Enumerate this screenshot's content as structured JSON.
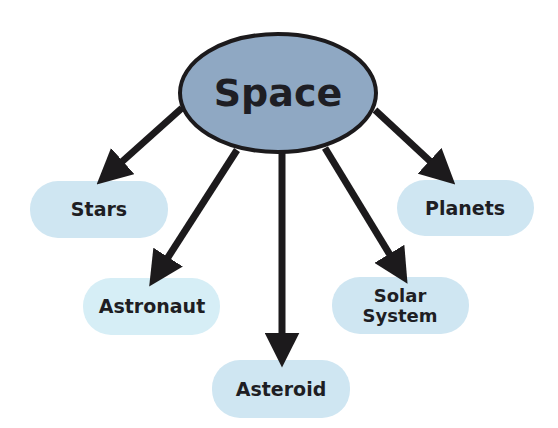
{
  "diagram": {
    "type": "mind-map",
    "colors": {
      "center_fill": "#8fa8c3",
      "center_stroke": "#1c1a1c",
      "leaf_fill": "#cfe6f2",
      "arrow": "#1c1a1c",
      "text": "#1e1e24"
    },
    "center": {
      "label": "Space"
    },
    "nodes": [
      {
        "id": "stars",
        "label": "Stars"
      },
      {
        "id": "astronaut",
        "label": "Astronaut"
      },
      {
        "id": "asteroid",
        "label": "Asteroid"
      },
      {
        "id": "solar-system",
        "label_line1": "Solar",
        "label_line2": "System"
      },
      {
        "id": "planets",
        "label": "Planets"
      }
    ],
    "edges": [
      {
        "from": "Space",
        "to": "Stars"
      },
      {
        "from": "Space",
        "to": "Astronaut"
      },
      {
        "from": "Space",
        "to": "Asteroid"
      },
      {
        "from": "Space",
        "to": "Solar System"
      },
      {
        "from": "Space",
        "to": "Planets"
      }
    ]
  }
}
